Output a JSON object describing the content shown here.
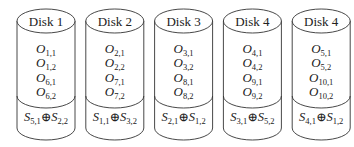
{
  "diagram": {
    "type": "disk-array-layout",
    "disks": [
      {
        "label": "Disk 1",
        "objects": [
          {
            "base": "O",
            "sub": "1,1"
          },
          {
            "base": "O",
            "sub": "1,2"
          },
          {
            "base": "O",
            "sub": "6,1"
          },
          {
            "base": "O",
            "sub": "6,2"
          }
        ],
        "parity": {
          "left": {
            "base": "S",
            "sub": "5,1"
          },
          "op": "⊕",
          "right": {
            "base": "S",
            "sub": "2,2"
          }
        }
      },
      {
        "label": "Disk 2",
        "objects": [
          {
            "base": "O",
            "sub": "2,1"
          },
          {
            "base": "O",
            "sub": "2,2"
          },
          {
            "base": "O",
            "sub": "7,1"
          },
          {
            "base": "O",
            "sub": "7,2"
          }
        ],
        "parity": {
          "left": {
            "base": "S",
            "sub": "1,1"
          },
          "op": "⊕",
          "right": {
            "base": "S",
            "sub": "3,2"
          }
        }
      },
      {
        "label": "Disk 3",
        "objects": [
          {
            "base": "O",
            "sub": "3,1"
          },
          {
            "base": "O",
            "sub": "3,2"
          },
          {
            "base": "O",
            "sub": "8,1"
          },
          {
            "base": "O",
            "sub": "8,2"
          }
        ],
        "parity": {
          "left": {
            "base": "S",
            "sub": "2,1"
          },
          "op": "⊕",
          "right": {
            "base": "S",
            "sub": "1,2"
          }
        }
      },
      {
        "label": "Disk 4",
        "objects": [
          {
            "base": "O",
            "sub": "4,1"
          },
          {
            "base": "O",
            "sub": "4,2"
          },
          {
            "base": "O",
            "sub": "9,1"
          },
          {
            "base": "O",
            "sub": "9,2"
          }
        ],
        "parity": {
          "left": {
            "base": "S",
            "sub": "3,1"
          },
          "op": "⊕",
          "right": {
            "base": "S",
            "sub": "5,2"
          }
        }
      },
      {
        "label": "Disk 4",
        "objects": [
          {
            "base": "O",
            "sub": "5,1"
          },
          {
            "base": "O",
            "sub": "5,2"
          },
          {
            "base": "O",
            "sub": "10,1"
          },
          {
            "base": "O",
            "sub": "10,2"
          }
        ],
        "parity": {
          "left": {
            "base": "S",
            "sub": "4,1"
          },
          "op": "⊕",
          "right": {
            "base": "S",
            "sub": "1,2"
          }
        }
      }
    ]
  }
}
